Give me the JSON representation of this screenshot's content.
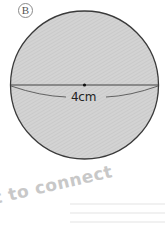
{
  "figure": {
    "label": "B",
    "measurement": "4cm",
    "shape": "circle",
    "fill_color": "#cfcfcf",
    "stroke_color": "#333333"
  },
  "watermark": {
    "text": "t to connect"
  }
}
